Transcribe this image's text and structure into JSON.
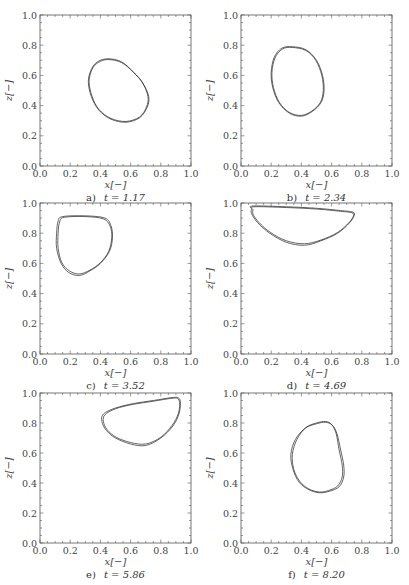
{
  "chart_data": [
    {
      "type": "line",
      "panel": "a",
      "caption_letter": "a)",
      "caption_text": "t = 1.17",
      "xlabel": "x[−]",
      "ylabel": "z[−]",
      "xlim": [
        0.0,
        1.0
      ],
      "ylim": [
        0.0,
        1.0
      ],
      "xticks": [
        "0.0",
        "0.2",
        "0.4",
        "0.6",
        "0.8",
        "1.0"
      ],
      "yticks": [
        "0.0",
        "0.2",
        "0.4",
        "0.6",
        "0.8",
        "1.0"
      ],
      "grid": false,
      "series": [
        {
          "name": "interface-1",
          "closed": true,
          "x": [
            0.45,
            0.54,
            0.62,
            0.68,
            0.72,
            0.71,
            0.66,
            0.57,
            0.47,
            0.39,
            0.34,
            0.32,
            0.34,
            0.38
          ],
          "y": [
            0.71,
            0.69,
            0.62,
            0.55,
            0.46,
            0.39,
            0.32,
            0.29,
            0.31,
            0.37,
            0.46,
            0.56,
            0.64,
            0.69
          ]
        },
        {
          "name": "interface-2",
          "closed": true,
          "x": [
            0.45,
            0.54,
            0.62,
            0.68,
            0.715,
            0.705,
            0.66,
            0.57,
            0.47,
            0.39,
            0.345,
            0.325,
            0.345,
            0.385
          ],
          "y": [
            0.705,
            0.685,
            0.62,
            0.55,
            0.46,
            0.39,
            0.325,
            0.295,
            0.315,
            0.375,
            0.46,
            0.56,
            0.64,
            0.685
          ]
        }
      ]
    },
    {
      "type": "line",
      "panel": "b",
      "caption_letter": "b)",
      "caption_text": "t = 2.34",
      "xlabel": "x[−]",
      "ylabel": "z[−]",
      "xlim": [
        0.0,
        1.0
      ],
      "ylim": [
        0.0,
        1.0
      ],
      "xticks": [
        "0.0",
        "0.2",
        "0.4",
        "0.6",
        "0.8",
        "1.0"
      ],
      "yticks": [
        "0.0",
        "0.2",
        "0.4",
        "0.6",
        "0.8",
        "1.0"
      ],
      "grid": false,
      "series": [
        {
          "name": "interface-1",
          "closed": true,
          "x": [
            0.34,
            0.43,
            0.5,
            0.54,
            0.55,
            0.53,
            0.47,
            0.4,
            0.32,
            0.25,
            0.21,
            0.2,
            0.22,
            0.27
          ],
          "y": [
            0.79,
            0.77,
            0.7,
            0.6,
            0.5,
            0.42,
            0.36,
            0.33,
            0.35,
            0.42,
            0.52,
            0.62,
            0.72,
            0.78
          ]
        },
        {
          "name": "interface-2",
          "closed": true,
          "x": [
            0.34,
            0.43,
            0.495,
            0.535,
            0.545,
            0.525,
            0.47,
            0.4,
            0.32,
            0.255,
            0.215,
            0.205,
            0.225,
            0.275
          ],
          "y": [
            0.785,
            0.765,
            0.7,
            0.6,
            0.5,
            0.42,
            0.365,
            0.335,
            0.355,
            0.42,
            0.52,
            0.62,
            0.715,
            0.775
          ]
        }
      ]
    },
    {
      "type": "line",
      "panel": "c",
      "caption_letter": "c)",
      "caption_text": "t = 3.52",
      "xlabel": "x[−]",
      "ylabel": "z[−]",
      "xlim": [
        0.0,
        1.0
      ],
      "ylim": [
        0.0,
        1.0
      ],
      "xticks": [
        "0.0",
        "0.2",
        "0.4",
        "0.6",
        "0.8",
        "1.0"
      ],
      "yticks": [
        "0.0",
        "0.2",
        "0.4",
        "0.6",
        "0.8",
        "1.0"
      ],
      "grid": false,
      "series": [
        {
          "name": "interface-1",
          "closed": true,
          "x": [
            0.15,
            0.3,
            0.43,
            0.47,
            0.48,
            0.46,
            0.4,
            0.33,
            0.26,
            0.19,
            0.14,
            0.11,
            0.11,
            0.12
          ],
          "y": [
            0.91,
            0.915,
            0.9,
            0.85,
            0.77,
            0.68,
            0.6,
            0.55,
            0.52,
            0.54,
            0.6,
            0.7,
            0.8,
            0.88
          ]
        },
        {
          "name": "interface-2",
          "closed": true,
          "x": [
            0.16,
            0.3,
            0.42,
            0.465,
            0.475,
            0.455,
            0.4,
            0.33,
            0.26,
            0.195,
            0.145,
            0.12,
            0.12,
            0.13
          ],
          "y": [
            0.905,
            0.91,
            0.895,
            0.845,
            0.77,
            0.68,
            0.605,
            0.555,
            0.53,
            0.55,
            0.605,
            0.7,
            0.8,
            0.875
          ]
        }
      ]
    },
    {
      "type": "line",
      "panel": "d",
      "caption_letter": "d)",
      "caption_text": "t = 4.69",
      "xlabel": "x[−]",
      "ylabel": "z[−]",
      "xlim": [
        0.0,
        1.0
      ],
      "ylim": [
        0.0,
        1.0
      ],
      "xticks": [
        "0.0",
        "0.2",
        "0.4",
        "0.6",
        "0.8",
        "1.0"
      ],
      "yticks": [
        "0.0",
        "0.2",
        "0.4",
        "0.6",
        "0.8",
        "1.0"
      ],
      "grid": false,
      "series": [
        {
          "name": "interface-1",
          "closed": true,
          "x": [
            0.08,
            0.3,
            0.5,
            0.66,
            0.74,
            0.75,
            0.72,
            0.64,
            0.53,
            0.42,
            0.3,
            0.19,
            0.11,
            0.07,
            0.07
          ],
          "y": [
            0.98,
            0.975,
            0.965,
            0.95,
            0.94,
            0.92,
            0.87,
            0.8,
            0.75,
            0.72,
            0.74,
            0.8,
            0.87,
            0.93,
            0.96
          ]
        },
        {
          "name": "interface-2",
          "closed": true,
          "x": [
            0.085,
            0.3,
            0.5,
            0.66,
            0.735,
            0.745,
            0.715,
            0.64,
            0.53,
            0.42,
            0.3,
            0.195,
            0.12,
            0.08,
            0.08
          ],
          "y": [
            0.975,
            0.97,
            0.96,
            0.945,
            0.935,
            0.915,
            0.87,
            0.805,
            0.755,
            0.73,
            0.75,
            0.805,
            0.87,
            0.925,
            0.955
          ]
        }
      ]
    },
    {
      "type": "line",
      "panel": "e",
      "caption_letter": "e)",
      "caption_text": "t = 5.86",
      "xlabel": "x[−]",
      "ylabel": "z[−]",
      "xlim": [
        0.0,
        1.0
      ],
      "ylim": [
        0.0,
        1.0
      ],
      "xticks": [
        "0.0",
        "0.2",
        "0.4",
        "0.6",
        "0.8",
        "1.0"
      ],
      "yticks": [
        "0.0",
        "0.2",
        "0.4",
        "0.6",
        "0.8",
        "1.0"
      ],
      "grid": false,
      "series": [
        {
          "name": "interface-1",
          "closed": true,
          "x": [
            0.42,
            0.5,
            0.62,
            0.75,
            0.88,
            0.92,
            0.93,
            0.92,
            0.88,
            0.8,
            0.7,
            0.6,
            0.5,
            0.44,
            0.41
          ],
          "y": [
            0.86,
            0.9,
            0.93,
            0.95,
            0.97,
            0.965,
            0.93,
            0.86,
            0.78,
            0.7,
            0.65,
            0.66,
            0.7,
            0.75,
            0.81
          ]
        },
        {
          "name": "interface-2",
          "closed": true,
          "x": [
            0.43,
            0.5,
            0.62,
            0.75,
            0.875,
            0.915,
            0.925,
            0.915,
            0.875,
            0.8,
            0.7,
            0.6,
            0.505,
            0.445,
            0.42
          ],
          "y": [
            0.855,
            0.895,
            0.925,
            0.945,
            0.965,
            0.96,
            0.925,
            0.86,
            0.785,
            0.705,
            0.66,
            0.67,
            0.705,
            0.755,
            0.81
          ]
        }
      ]
    },
    {
      "type": "line",
      "panel": "f",
      "caption_letter": "f)",
      "caption_text": "t = 8.20",
      "xlabel": "x[−]",
      "ylabel": "z[−]",
      "xlim": [
        0.0,
        1.0
      ],
      "ylim": [
        0.0,
        1.0
      ],
      "xticks": [
        "0.0",
        "0.2",
        "0.4",
        "0.6",
        "0.8",
        "1.0"
      ],
      "yticks": [
        "0.0",
        "0.2",
        "0.4",
        "0.6",
        "0.8",
        "1.0"
      ],
      "grid": false,
      "series": [
        {
          "name": "interface-1",
          "closed": true,
          "x": [
            0.56,
            0.6,
            0.63,
            0.65,
            0.67,
            0.67,
            0.64,
            0.58,
            0.52,
            0.45,
            0.39,
            0.35,
            0.34,
            0.37,
            0.43,
            0.5
          ],
          "y": [
            0.81,
            0.79,
            0.73,
            0.62,
            0.52,
            0.44,
            0.38,
            0.35,
            0.34,
            0.36,
            0.41,
            0.49,
            0.59,
            0.69,
            0.77,
            0.8
          ]
        },
        {
          "name": "interface-2",
          "closed": true,
          "x": [
            0.56,
            0.605,
            0.635,
            0.66,
            0.68,
            0.68,
            0.65,
            0.585,
            0.52,
            0.45,
            0.385,
            0.345,
            0.33,
            0.36,
            0.425,
            0.5
          ],
          "y": [
            0.805,
            0.785,
            0.73,
            0.62,
            0.52,
            0.44,
            0.375,
            0.345,
            0.335,
            0.355,
            0.405,
            0.49,
            0.59,
            0.69,
            0.765,
            0.795
          ]
        }
      ]
    }
  ],
  "colors": {
    "curve": "#333333",
    "axis": "#555555",
    "text": "#444444",
    "background": "#ffffff"
  }
}
